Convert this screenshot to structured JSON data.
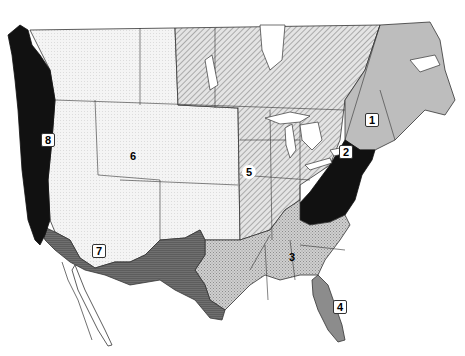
{
  "map": {
    "type": "regional map",
    "area": "United States and southern Canada",
    "style": "black-and-white, pattern-filled regions with state/province borders",
    "regions": [
      {
        "id": "1",
        "label": "1",
        "fill": "light gray (solid)",
        "area_description": "New England, New York, Quebec, Maritime provinces"
      },
      {
        "id": "2",
        "label": "2",
        "fill": "black",
        "area_description": "Mid-Atlantic (Pennsylvania, Maryland, Virginia, West Virginia)"
      },
      {
        "id": "3",
        "label": "3",
        "fill": "crosshatch gray",
        "area_description": "Southeast and south-central states"
      },
      {
        "id": "4",
        "label": "4",
        "fill": "medium gray",
        "area_description": "Florida peninsula"
      },
      {
        "id": "5",
        "label": "5",
        "fill": "diagonal hatch",
        "area_description": "Midwest, Great Plains and central Canada"
      },
      {
        "id": "6",
        "label": "6",
        "fill": "white / fine dot",
        "area_description": "Mountain West and western Canada"
      },
      {
        "id": "7",
        "label": "7",
        "fill": "dark gray horizontal lines",
        "area_description": "Desert Southwest and inland California"
      },
      {
        "id": "8",
        "label": "8",
        "fill": "black",
        "area_description": "Pacific coast (Washington, Oregon, coastal California, British Columbia coast)"
      }
    ]
  },
  "labels": {
    "r1": "1",
    "r2": "2",
    "r3": "3",
    "r4": "4",
    "r5": "5",
    "r6": "6",
    "r7": "7",
    "r8": "8"
  },
  "colors": {
    "background": "#ffffff",
    "outline": "#222222",
    "region_black": "#111111",
    "region_dark_gray": "#6e6e6e",
    "region_medium_gray": "#8c8c8c",
    "region_light_gray": "#bdbdbd",
    "region_crosshatch": "#c4c4c4",
    "region_light": "#ececec"
  }
}
